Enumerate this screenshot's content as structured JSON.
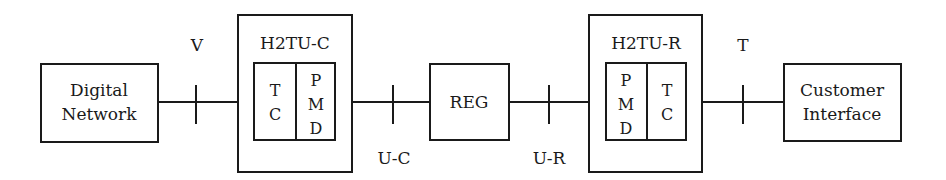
{
  "diagram": {
    "colors": {
      "stroke": "#1a1a1a",
      "background": "#ffffff"
    },
    "blocks": {
      "digital_network": {
        "line1": "Digital",
        "line2": "Network"
      },
      "h2tu_c": {
        "title": "H2TU-C",
        "tc": [
          "T",
          "C"
        ],
        "pmd": [
          "P",
          "M",
          "D"
        ]
      },
      "reg": {
        "label": "REG"
      },
      "h2tu_r": {
        "title": "H2TU-R",
        "pmd": [
          "P",
          "M",
          "D"
        ],
        "tc": [
          "T",
          "C"
        ]
      },
      "customer_interface": {
        "line1": "Customer",
        "line2": "Interface"
      }
    },
    "reference_points": {
      "v": "V",
      "u_c": "U-C",
      "u_r": "U-R",
      "t": "T"
    }
  }
}
